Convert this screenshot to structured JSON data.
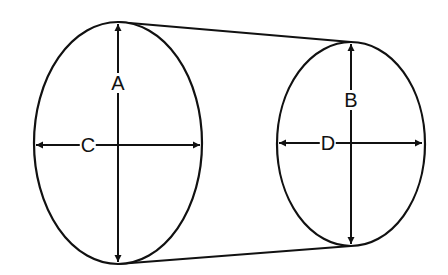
{
  "diagram": {
    "title": "",
    "colors": {
      "stroke": "#111111",
      "background": "#ffffff"
    },
    "shapes": {
      "left_ellipse": {
        "cx": 118,
        "cy": 143,
        "rx": 84,
        "ry": 121
      },
      "right_ellipse": {
        "cx": 351,
        "cy": 144,
        "rx": 74,
        "ry": 102
      },
      "top_line": {
        "x1": 118,
        "y1": 22,
        "x2": 351,
        "y2": 42
      },
      "bottom_line": {
        "x1": 118,
        "y1": 264,
        "x2": 351,
        "y2": 246
      }
    },
    "labels": {
      "A": {
        "text": "A",
        "meaning": "vertical dimension of left (large) end",
        "x": 118,
        "y": 83
      },
      "B": {
        "text": "B",
        "meaning": "vertical dimension of right (small) end",
        "x": 351,
        "y": 100
      },
      "C": {
        "text": "C",
        "meaning": "horizontal dimension of left (large) end",
        "x": 88,
        "y": 145
      },
      "D": {
        "text": "D",
        "meaning": "horizontal dimension of right (small) end",
        "x": 328,
        "y": 143
      }
    }
  }
}
